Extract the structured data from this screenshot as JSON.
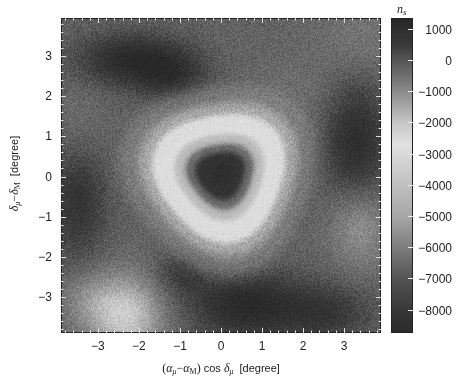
{
  "chart_data": {
    "type": "heatmap",
    "title": "",
    "xlabel": "(αμ − αM) cos δμ [degree]",
    "xlabel_parts": {
      "open": "(",
      "a1": "α",
      "s1": "μ",
      "minus": "−",
      "a2": "α",
      "s2": "M",
      "close": ")",
      "cos": " cos ",
      "d": "δ",
      "s3": "μ",
      "unit": "[degree]"
    },
    "ylabel": "δμ − δM [degree]",
    "ylabel_parts": {
      "d1": "δ",
      "s1": "μ",
      "minus": "−",
      "d2": "δ",
      "s2": "M",
      "unit": "[degree]"
    },
    "xlim": [
      -3.9,
      3.9
    ],
    "ylim": [
      -3.9,
      3.95
    ],
    "xticks": [
      -3,
      -2,
      -1,
      0,
      1,
      2,
      3
    ],
    "xtick_labels": [
      "−3",
      "−2",
      "−1",
      "0",
      "1",
      "2",
      "3"
    ],
    "yticks": [
      3,
      2,
      1,
      0,
      -1,
      -2,
      -3
    ],
    "ytick_labels": [
      "3",
      "2",
      "1",
      "0",
      "−1",
      "−2",
      "−3"
    ],
    "colorbar": {
      "label": "n",
      "label_sub": "s",
      "range": [
        -8750,
        1350
      ],
      "ticks": [
        1000,
        0,
        -1000,
        -2000,
        -3000,
        -4000,
        -5000,
        -6000,
        -7000,
        -8000
      ],
      "tick_labels": [
        "1000",
        "0",
        "−1000",
        "−2000",
        "−3000",
        "−4000",
        "−5000",
        "−6000",
        "−7000",
        "−8000"
      ],
      "colormap": [
        {
          "value": 1350,
          "color": "#262626"
        },
        {
          "value": 500,
          "color": "#3a3a3a"
        },
        {
          "value": 0,
          "color": "#555555"
        },
        {
          "value": -1000,
          "color": "#8a8a8a"
        },
        {
          "value": -2000,
          "color": "#c6c6c6"
        },
        {
          "value": -2700,
          "color": "#e2e2e2"
        },
        {
          "value": -4000,
          "color": "#c0c0c0"
        },
        {
          "value": -5000,
          "color": "#a8a8a8"
        },
        {
          "value": -6000,
          "color": "#7e7e7e"
        },
        {
          "value": -7000,
          "color": "#545454"
        },
        {
          "value": -8000,
          "color": "#383838"
        },
        {
          "value": -8750,
          "color": "#2a2a2a"
        }
      ]
    },
    "field_model": {
      "background_value": -250,
      "center": [
        0.0,
        0.05
      ],
      "radial_profile": [
        {
          "r": 0.0,
          "value": -8600
        },
        {
          "r": 0.45,
          "value": -8300
        },
        {
          "r": 0.7,
          "value": -6500
        },
        {
          "r": 0.95,
          "value": -4200
        },
        {
          "r": 1.2,
          "value": -2800
        },
        {
          "r": 1.45,
          "value": -2600
        },
        {
          "r": 1.7,
          "value": -1500
        },
        {
          "r": 2.1,
          "value": -700
        },
        {
          "r": 2.6,
          "value": -250
        }
      ],
      "ring_shape": {
        "triangularity": 0.08,
        "orientation_deg": -20
      },
      "blobs": [
        {
          "x": -2.2,
          "y": 2.9,
          "sx": 0.9,
          "sy": 0.45,
          "value": 1100
        },
        {
          "x": -1.2,
          "y": 2.5,
          "sx": 0.6,
          "sy": 0.45,
          "value": 700
        },
        {
          "x": 3.3,
          "y": 0.9,
          "sx": 0.55,
          "sy": 1.0,
          "value": 1000
        },
        {
          "x": 0.6,
          "y": -3.2,
          "sx": 0.9,
          "sy": 0.6,
          "value": 1200
        },
        {
          "x": 2.5,
          "y": -3.4,
          "sx": 0.8,
          "sy": 0.5,
          "value": 700
        },
        {
          "x": -3.5,
          "y": -0.6,
          "sx": 0.5,
          "sy": 1.0,
          "value": 800
        },
        {
          "x": -0.9,
          "y": -2.4,
          "sx": 0.5,
          "sy": 0.4,
          "value": 500
        },
        {
          "x": -2.3,
          "y": -3.5,
          "sx": 0.6,
          "sy": 0.7,
          "value": -2100
        },
        {
          "x": -3.2,
          "y": -3.1,
          "sx": 0.5,
          "sy": 0.5,
          "value": -900
        },
        {
          "x": 3.4,
          "y": -1.3,
          "sx": 0.5,
          "sy": 0.7,
          "value": -1100
        },
        {
          "x": 3.4,
          "y": 3.4,
          "sx": 0.8,
          "sy": 0.7,
          "value": -600
        },
        {
          "x": -3.5,
          "y": 1.2,
          "sx": 0.5,
          "sy": 0.8,
          "value": -500
        },
        {
          "x": 1.6,
          "y": 2.0,
          "sx": 0.8,
          "sy": 0.6,
          "value": -500
        }
      ],
      "noise_amplitude": 350
    },
    "grid_estimate": {
      "x": [
        -3.6,
        -3.0,
        -2.4,
        -1.8,
        -1.2,
        -0.6,
        0.0,
        0.6,
        1.2,
        1.8,
        2.4,
        3.0,
        3.6
      ],
      "y": [
        3.6,
        3.0,
        2.4,
        1.8,
        1.2,
        0.6,
        0.0,
        -0.6,
        -1.2,
        -1.8,
        -2.4,
        -3.0,
        -3.6
      ],
      "values": [
        [
          -300,
          200,
          500,
          300,
          -100,
          -300,
          -300,
          -300,
          -400,
          -400,
          -500,
          -600,
          -700
        ],
        [
          -200,
          600,
          1100,
          900,
          500,
          -100,
          -400,
          -500,
          -500,
          -400,
          -300,
          -200,
          -300
        ],
        [
          -300,
          300,
          700,
          800,
          600,
          0,
          -600,
          -900,
          -900,
          -500,
          -200,
          0,
          -100
        ],
        [
          -500,
          -200,
          0,
          100,
          -300,
          -1700,
          -2600,
          -2300,
          -1200,
          -400,
          200,
          500,
          400
        ],
        [
          -600,
          -300,
          -300,
          -900,
          -2600,
          -3500,
          -4000,
          -3200,
          -2400,
          -700,
          200,
          800,
          900
        ],
        [
          -300,
          -200,
          -600,
          -1700,
          -3000,
          -6500,
          -8200,
          -6400,
          -2800,
          -1000,
          100,
          700,
          900
        ],
        [
          100,
          -100,
          -600,
          -1600,
          -2800,
          -8000,
          -8600,
          -7800,
          -2900,
          -1100,
          -100,
          300,
          500
        ],
        [
          500,
          200,
          -500,
          -1500,
          -2700,
          -4800,
          -6500,
          -4600,
          -2700,
          -1200,
          -400,
          -700,
          -800
        ],
        [
          300,
          100,
          -300,
          -700,
          -1700,
          -2700,
          -2800,
          -2700,
          -1700,
          -800,
          -400,
          -1000,
          -1100
        ],
        [
          -100,
          -300,
          -500,
          -400,
          -300,
          -500,
          -700,
          -600,
          -400,
          -200,
          -300,
          -600,
          -600
        ],
        [
          -600,
          -800,
          -900,
          -300,
          300,
          400,
          300,
          500,
          600,
          300,
          200,
          0,
          -100
        ],
        [
          -800,
          -1200,
          -1700,
          -1200,
          -300,
          300,
          700,
          900,
          800,
          700,
          600,
          400,
          200
        ],
        [
          -900,
          -1500,
          -2100,
          -1600,
          -600,
          200,
          800,
          1100,
          900,
          700,
          800,
          500,
          300
        ]
      ]
    }
  }
}
